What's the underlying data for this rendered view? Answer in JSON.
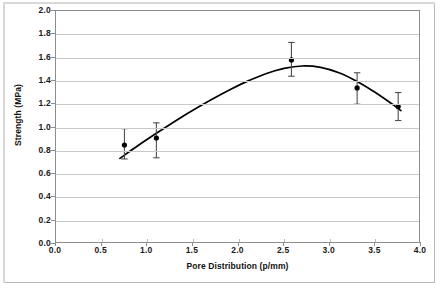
{
  "chart_data": {
    "type": "scatter",
    "title": "",
    "xlabel": "Pore Distribution (p/mm)",
    "ylabel": "Strength (MPa)",
    "xlim": [
      0.0,
      4.0
    ],
    "ylim": [
      0.0,
      2.0
    ],
    "xticks": [
      "0.0",
      "0.5",
      "1.0",
      "1.5",
      "2.0",
      "2.5",
      "3.0",
      "3.5",
      "4.0"
    ],
    "xtick_values": [
      0.0,
      0.5,
      1.0,
      1.5,
      2.0,
      2.5,
      3.0,
      3.5,
      4.0
    ],
    "yticks": [
      "0.0",
      "0.2",
      "0.4",
      "0.6",
      "0.8",
      "1.0",
      "1.2",
      "1.4",
      "1.6",
      "1.8",
      "2.0"
    ],
    "ytick_values": [
      0.0,
      0.2,
      0.4,
      0.6,
      0.8,
      1.0,
      1.2,
      1.4,
      1.6,
      1.8,
      2.0
    ],
    "grid": "horizontal",
    "legend": "none",
    "marker": "filled-circle",
    "marker_color": "#000000",
    "errorbar_color": "#4d4d4d",
    "trendline_color": "#000000",
    "trendline_type": "quadratic-fit",
    "points": [
      {
        "x": 0.75,
        "y": 0.85,
        "yerr_low": 0.73,
        "yerr_high": 0.99
      },
      {
        "x": 1.1,
        "y": 0.91,
        "yerr_low": 0.74,
        "yerr_high": 1.04
      },
      {
        "x": 2.58,
        "y": 1.58,
        "yerr_low": 1.44,
        "yerr_high": 1.73
      },
      {
        "x": 3.3,
        "y": 1.34,
        "yerr_low": 1.2,
        "yerr_high": 1.47
      },
      {
        "x": 3.75,
        "y": 1.18,
        "yerr_low": 1.06,
        "yerr_high": 1.3
      }
    ],
    "trendline": [
      {
        "x": 0.7,
        "y": 0.735
      },
      {
        "x": 0.9,
        "y": 0.845
      },
      {
        "x": 1.1,
        "y": 0.95
      },
      {
        "x": 1.3,
        "y": 1.052
      },
      {
        "x": 1.5,
        "y": 1.148
      },
      {
        "x": 1.7,
        "y": 1.238
      },
      {
        "x": 1.9,
        "y": 1.322
      },
      {
        "x": 2.1,
        "y": 1.398
      },
      {
        "x": 2.3,
        "y": 1.462
      },
      {
        "x": 2.5,
        "y": 1.508
      },
      {
        "x": 2.7,
        "y": 1.528
      },
      {
        "x": 2.9,
        "y": 1.516
      },
      {
        "x": 3.1,
        "y": 1.47
      },
      {
        "x": 3.3,
        "y": 1.395
      },
      {
        "x": 3.5,
        "y": 1.3
      },
      {
        "x": 3.7,
        "y": 1.192
      },
      {
        "x": 3.78,
        "y": 1.145
      }
    ]
  }
}
